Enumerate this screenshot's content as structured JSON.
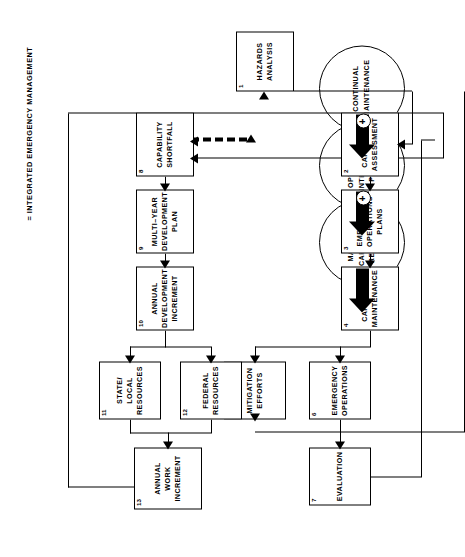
{
  "diagram": {
    "legend": "=  INTEGRATED EMERGENCY MANAGEMENT",
    "plus_symbol": "+",
    "circles": [
      {
        "id": "maximum-capability",
        "label": "MAXIMUM\nCAPABILITY\nREQUIRED"
      },
      {
        "id": "optimally-integrated-plans",
        "label": "OPTIMALLY\nINTEGRATED\nPLAN(S)"
      },
      {
        "id": "continual-maintenance",
        "label": "CONTINUAL\nMAINTENANCE"
      }
    ],
    "boxes": [
      {
        "num": "1",
        "id": "hazards-analysis",
        "label": "HAZARDS\nANALYSIS"
      },
      {
        "num": "2",
        "id": "capability-assessment",
        "label": "CAPABILITY\nASSESSMENT"
      },
      {
        "num": "3",
        "id": "emergency-operations-plans",
        "label": "EMERGENCY\nOPERATIONS\nPLANS"
      },
      {
        "num": "4",
        "id": "capability-maintenance",
        "label": "CAPABILITY\nMAINTENANCE"
      },
      {
        "num": "5",
        "id": "mitigation-efforts",
        "label": "MITIGATION\nEFFORTS"
      },
      {
        "num": "6",
        "id": "emergency-operations",
        "label": "EMERGENCY\nOPERATIONS"
      },
      {
        "num": "7",
        "id": "evaluation",
        "label": "EVALUATION"
      },
      {
        "num": "8",
        "id": "capability-shortfall",
        "label": "CAPABILITY\nSHORTFALL"
      },
      {
        "num": "9",
        "id": "multi-year-development-plan",
        "label": "MULTI–YEAR\nDEVELOPMENT\nPLAN"
      },
      {
        "num": "10",
        "id": "annual-development-increment",
        "label": "ANNUAL\nDEVELOPMENT\nINCREMENT"
      },
      {
        "num": "11",
        "id": "state-local-resources",
        "label": "STATE/\nLOCAL\nRESOURCES"
      },
      {
        "num": "12",
        "id": "federal-resources",
        "label": "FEDERAL\nRESOURCES"
      },
      {
        "num": "13",
        "id": "annual-work-increment",
        "label": "ANNUAL\nWORK\nINCREMENT"
      }
    ],
    "colors": {
      "ink": "#000000",
      "paper": "#ffffff"
    }
  }
}
